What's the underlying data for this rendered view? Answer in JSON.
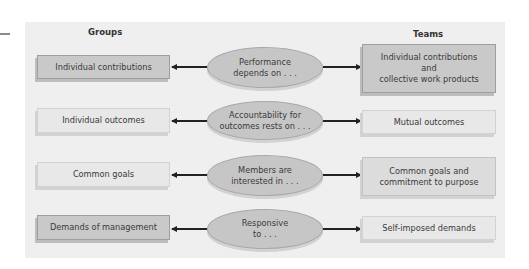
{
  "headers": {
    "groups": "Groups",
    "teams": "Teams"
  },
  "rows": [
    {
      "group": "Individual contributions",
      "criterion": [
        "Performance",
        "depends on . . ."
      ],
      "team": [
        "Individual contributions",
        "and",
        "collective work products"
      ]
    },
    {
      "group": "Individual outcomes",
      "criterion": [
        "Accountability for",
        "outcomes rests on . . ."
      ],
      "team": [
        "Mutual outcomes"
      ]
    },
    {
      "group": "Common goals",
      "criterion": [
        "Members are",
        "interested in . . ."
      ],
      "team": [
        "Common goals and",
        "commitment to purpose"
      ]
    },
    {
      "group": "Demands of management",
      "criterion": [
        "Responsive",
        "to . . ."
      ],
      "team": [
        "Self-imposed demands"
      ]
    }
  ],
  "colors": {
    "panel": "#efefef",
    "box_dark": "#c9c9c9",
    "box_mid": "#dcdcdc",
    "box_light": "#e8e8e8",
    "ellipse": "#c6c6c6",
    "arrow": "#222222"
  }
}
